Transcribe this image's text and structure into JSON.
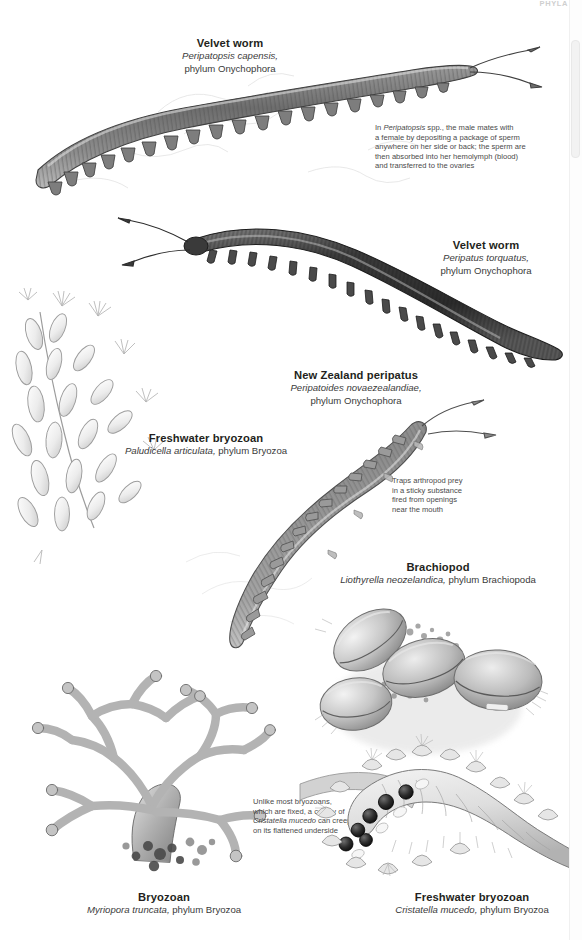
{
  "page": {
    "running_head": "PHYLA",
    "background_color": "#ffffff",
    "ink_color": "#231f20"
  },
  "labels": [
    {
      "id": "velvet-worm-capensis",
      "common_name": "Velvet worm",
      "species": "Peripatopsis capensis,",
      "phylum": "phylum Onychophora"
    },
    {
      "id": "velvet-worm-torquatus",
      "common_name": "Velvet worm",
      "species": "Peripatus torquatus,",
      "phylum": "phylum Onychophora"
    },
    {
      "id": "new-zealand-peripatus",
      "common_name": "New Zealand peripatus",
      "species": "Peripatoides novaezealandiae,",
      "phylum": "phylum Onychophora"
    },
    {
      "id": "freshwater-bryozoan-paludicella",
      "common_name": "Freshwater bryozoan",
      "species": "Paludicella articulata,",
      "phylum": "phylum Bryozoa"
    },
    {
      "id": "brachiopod",
      "common_name": "Brachiopod",
      "species": "Liothyrella neozelandica,",
      "phylum": "phylum Brachiopoda"
    },
    {
      "id": "bryozoan-myriopora",
      "common_name": "Bryozoan",
      "species": "Myriopora truncata,",
      "phylum": "phylum Bryozoa"
    },
    {
      "id": "freshwater-bryozoan-cristatella",
      "common_name": "Freshwater bryozoan",
      "species": "Cristatella mucedo,",
      "phylum": "phylum Bryozoa"
    }
  ],
  "annotations": {
    "peripatopsis_mating": {
      "line1": "In Peripatopsis spp., the male mates with",
      "line2": "a female by depositing a package of sperm",
      "line3": "anywhere on her side or back; the sperm are",
      "line4": "then absorbed into her hemolymph (blood)",
      "line5": "and transferred to the ovaries"
    },
    "slime_jets": {
      "line1": "Traps arthropod prey",
      "line2": "in a sticky substance",
      "line3": "fired from openings",
      "line4": "near the mouth"
    },
    "cristatella_creeping": {
      "line1": "Unlike most bryozoans,",
      "line2": "which are fixed, a colony of",
      "line3": "Cristatella mucedo can creep",
      "line4": "on its flattened underside"
    }
  },
  "illustrations": [
    {
      "id": "velvet-worm-capensis-illustration",
      "caption_for": "Peripatopsis capensis"
    },
    {
      "id": "velvet-worm-torquatus-illustration",
      "caption_for": "Peripatus torquatus"
    },
    {
      "id": "new-zealand-peripatus-illustration",
      "caption_for": "Peripatoides novaezealandiae"
    },
    {
      "id": "paludicella-illustration",
      "caption_for": "Paludicella articulata"
    },
    {
      "id": "brachiopod-illustration",
      "caption_for": "Liothyrella neozelandica"
    },
    {
      "id": "myriopora-illustration",
      "caption_for": "Myriopora truncata"
    },
    {
      "id": "cristatella-illustration",
      "caption_for": "Cristatella mucedo"
    }
  ]
}
